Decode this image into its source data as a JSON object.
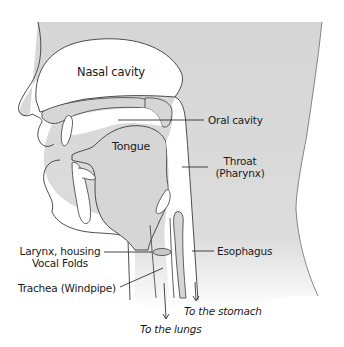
{
  "diagram": {
    "colors": {
      "tissue": "#d9d9d9",
      "outline": "#3a3a3a",
      "background": "#ffffff",
      "text": "#1a1a1a"
    },
    "labels": {
      "nasal_cavity": "Nasal cavity",
      "oral_cavity": "Oral cavity",
      "tongue": "Tongue",
      "throat_line1": "Throat",
      "throat_line2": "(Pharynx)",
      "larynx_line1": "Larynx, housing",
      "larynx_line2": "Vocal Folds",
      "esophagus": "Esophagus",
      "trachea": "Trachea (Windpipe)",
      "to_stomach": "To the stomach",
      "to_lungs": "To the lungs"
    }
  }
}
